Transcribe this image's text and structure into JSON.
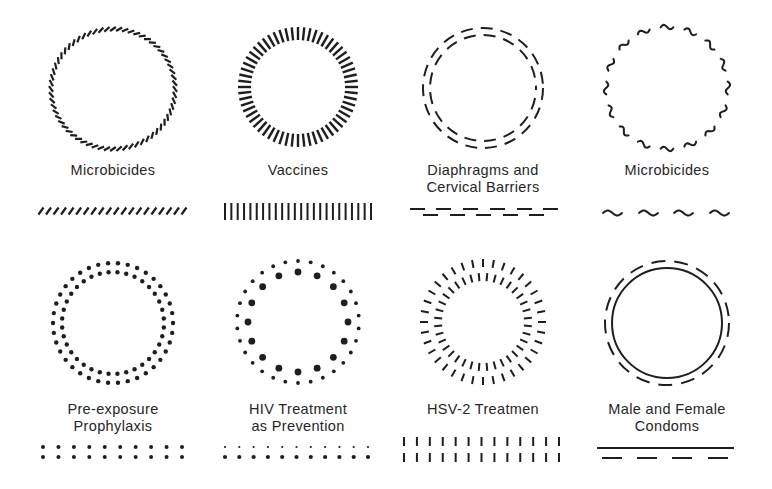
{
  "style": {
    "ink": "#1e1e1e",
    "text": "#262626",
    "background": "#ffffff"
  },
  "cells": [
    {
      "id": "microbicides-hatched",
      "title_lines": [
        "Microbicides"
      ],
      "label_x": 20,
      "label_y": 162,
      "icon": {
        "type": "slanted-tick-ring",
        "cx": 113,
        "cy": 89,
        "rx": 62,
        "ry": 60,
        "count": 64,
        "len": 7,
        "angle": 55,
        "width": 2.2
      },
      "pattern": {
        "type": "slashes",
        "x0": 41,
        "x1": 184,
        "y": 211,
        "count": 20,
        "h": 7,
        "dx": 5,
        "width": 2.2
      }
    },
    {
      "id": "vaccines",
      "title_lines": [
        "Vaccines"
      ],
      "label_x": 205,
      "label_y": 162,
      "icon": {
        "type": "radial-tick-ring",
        "cx": 298,
        "cy": 87,
        "r_in": 47,
        "r_out": 60,
        "count": 60,
        "width": 2.4
      },
      "pattern": {
        "type": "bars",
        "x0": 225,
        "x1": 371,
        "y0": 203,
        "y1": 220,
        "count": 24,
        "width": 2
      }
    },
    {
      "id": "diaphragms",
      "title_lines": [
        "Diaphragms and",
        "Cervical Barriers"
      ],
      "label_x": 390,
      "label_y": 162,
      "icon": {
        "type": "double-dashed-ring",
        "cx": 483,
        "cy": 88,
        "r_out": 60,
        "r_in": 53,
        "dash_out": [
          12,
          8
        ],
        "dash_in": [
          12,
          8
        ],
        "width": 2
      },
      "pattern": {
        "type": "staggered-dashes",
        "top": {
          "y": 209,
          "starts": [
            410,
            436,
            463,
            490,
            517,
            543
          ],
          "len": 15
        },
        "bottom": {
          "y": 215,
          "starts": [
            423,
            450,
            476,
            503,
            529
          ],
          "len": 15
        },
        "width": 2
      }
    },
    {
      "id": "microbicides-wavy",
      "title_lines": [
        "Microbicides"
      ],
      "label_x": 574,
      "label_y": 162,
      "icon": {
        "type": "wavy-dash-ring",
        "cx": 667,
        "cy": 88,
        "r": 61,
        "count": 16,
        "arc_deg": 12,
        "amp": 2.2,
        "width": 2
      },
      "pattern": {
        "type": "waves",
        "starts": [
          603,
          639,
          674,
          710
        ],
        "len": 19,
        "y": 213,
        "amp": 2.5,
        "width": 2
      }
    },
    {
      "id": "prep",
      "title_lines": [
        "Pre-exposure",
        "Prophylaxis"
      ],
      "label_x": 20,
      "label_y": 401,
      "icon": {
        "type": "double-dot-ring",
        "cx": 113,
        "cy": 323,
        "r_out": 60,
        "r_in": 51,
        "count_out": 38,
        "count_in": 36,
        "dot_r_out": 2.2,
        "dot_r_in": 2.2,
        "offset_in_deg": 5
      },
      "pattern": {
        "type": "dot-grid",
        "x0": 43,
        "x1": 182,
        "rows": [
          {
            "y": 447,
            "r": 2
          },
          {
            "y": 457,
            "r": 2
          }
        ],
        "cols": 10
      }
    },
    {
      "id": "hiv-tasp",
      "title_lines": [
        "HIV Treatment",
        "as Prevention"
      ],
      "label_x": 205,
      "label_y": 401,
      "icon": {
        "type": "mixed-dot-ring",
        "cx": 298,
        "cy": 322,
        "r_out": 61,
        "r_in": 50,
        "count_out": 30,
        "count_in": 16,
        "dot_r_out": 1.9,
        "dot_r_in": 3.4,
        "offset_out_deg": 6
      },
      "pattern": {
        "type": "dot-grid",
        "x0": 225,
        "x1": 368,
        "rows": [
          {
            "y": 447,
            "r": 1.1
          },
          {
            "y": 457,
            "r": 2.1
          }
        ],
        "cols": 11
      }
    },
    {
      "id": "hsv2",
      "title_lines": [
        "HSV-2 Treatmen"
      ],
      "label_x": 390,
      "label_y": 401,
      "icon": {
        "type": "double-radial-tick-ring",
        "cx": 483,
        "cy": 322,
        "outer": {
          "r_in": 55,
          "r_out": 63,
          "count": 36,
          "offset_deg": 0
        },
        "inner": {
          "r_in": 41,
          "r_out": 49,
          "count": 36,
          "offset_deg": 5
        },
        "width": 2
      },
      "pattern": {
        "type": "tick-grid",
        "x0": 404,
        "x1": 559,
        "cols": 13,
        "rows": [
          {
            "y0": 437,
            "y1": 446
          },
          {
            "y0": 453,
            "y1": 462
          }
        ],
        "width": 2
      }
    },
    {
      "id": "condoms",
      "title_lines": [
        "Male and Female",
        "Condoms"
      ],
      "label_x": 574,
      "label_y": 401,
      "icon": {
        "type": "solid-and-dashed-ring",
        "cx": 667,
        "cy": 323,
        "r_solid": 55,
        "r_dashed": 62,
        "dash": [
          14,
          9
        ],
        "width": 2
      },
      "pattern": {
        "type": "line-and-dashes",
        "line": {
          "x0": 597,
          "x1": 734,
          "y": 448
        },
        "dashes": {
          "y": 458,
          "starts": [
            602,
            637,
            672,
            708
          ],
          "len": 20
        },
        "width": 2
      }
    }
  ]
}
